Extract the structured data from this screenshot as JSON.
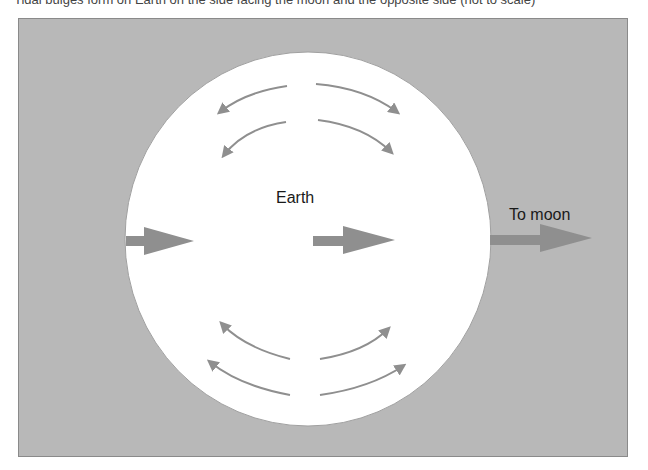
{
  "caption": "Tidal bulges form on Earth on the side facing the moon and the opposite side (not to scale)",
  "diagram": {
    "title_label": "Earth",
    "moon_label": "To moon",
    "colors": {
      "background": "#b8b8b8",
      "earth": "#ffffff",
      "arrow": "#8f8f8f",
      "text": "#1a1a1a"
    },
    "arrows": [
      {
        "id": "left-force",
        "direction": "right",
        "type": "thick"
      },
      {
        "id": "center-force",
        "direction": "right",
        "type": "thick"
      },
      {
        "id": "moon-force",
        "direction": "right",
        "type": "thick"
      },
      {
        "id": "top-flow-upper-left",
        "direction": "left",
        "type": "curved"
      },
      {
        "id": "top-flow-upper-right",
        "direction": "right",
        "type": "curved"
      },
      {
        "id": "top-flow-lower-left",
        "direction": "left",
        "type": "curved"
      },
      {
        "id": "top-flow-lower-right",
        "direction": "right",
        "type": "curved"
      },
      {
        "id": "bottom-flow-upper-left",
        "direction": "left",
        "type": "curved"
      },
      {
        "id": "bottom-flow-upper-right",
        "direction": "right",
        "type": "curved"
      },
      {
        "id": "bottom-flow-lower-left",
        "direction": "left",
        "type": "curved"
      },
      {
        "id": "bottom-flow-lower-right",
        "direction": "right",
        "type": "curved"
      }
    ]
  }
}
